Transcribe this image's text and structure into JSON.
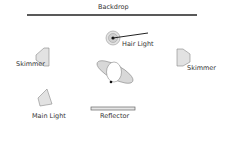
{
  "diagram": {
    "type": "studio-lighting-setup",
    "labels": {
      "backdrop": "Backdrop",
      "hair_light": "Hair Light",
      "skimmer_left": "Skimmer",
      "skimmer_right": "Skimmer",
      "main_light": "Main Light",
      "reflector": "Reflector"
    },
    "colors": {
      "line": "#222222",
      "fill": "#e2e2e2",
      "outline": "#888888",
      "text": "#333333"
    }
  }
}
